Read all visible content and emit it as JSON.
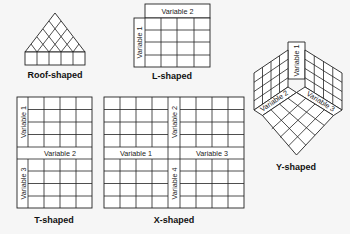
{
  "diagram": {
    "shapes": [
      {
        "id": "roof",
        "caption": "Roof-shaped",
        "labels": []
      },
      {
        "id": "l",
        "caption": "L-shaped",
        "labels": [
          "Variable 2",
          "Variable 1"
        ]
      },
      {
        "id": "y",
        "caption": "Y-shaped",
        "labels": [
          "Variable 1",
          "Variable 2",
          "Variable 3"
        ]
      },
      {
        "id": "t",
        "caption": "T-shaped",
        "labels": [
          "Variable 1",
          "Variable 2",
          "Variable 3"
        ]
      },
      {
        "id": "x",
        "caption": "X-shaped",
        "labels": [
          "Variable 2",
          "Variable 1",
          "Variable 3",
          "Variable 4"
        ]
      }
    ]
  }
}
